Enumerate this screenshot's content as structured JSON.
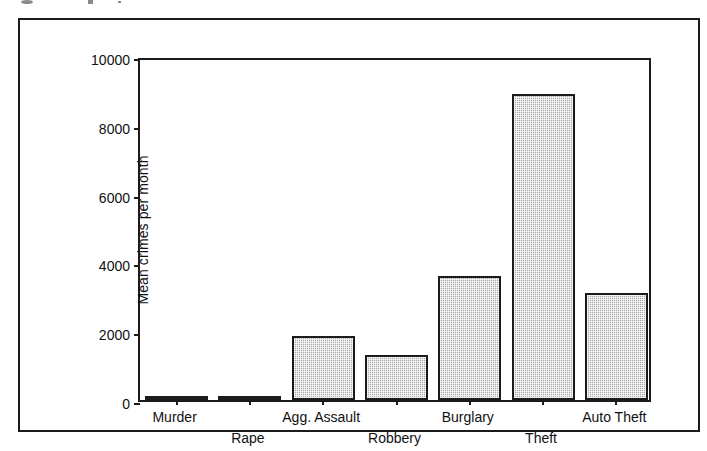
{
  "figure": {
    "background_color": "#ffffff",
    "frame_color": "#1b1b1b",
    "bar_fill_color": "#a8a8a8",
    "bar_edge_color": "#1b1b1b"
  },
  "chart_data": {
    "type": "bar",
    "title": "",
    "xlabel": "",
    "ylabel": "Mean crimes per month",
    "categories": [
      "Murder",
      "Rape",
      "Agg. Assault",
      "Robbery",
      "Burglary",
      "Theft",
      "Auto Theft"
    ],
    "values": [
      20,
      130,
      1860,
      1310,
      3610,
      8900,
      3110
    ],
    "ylim": [
      0,
      10000
    ],
    "yticks": [
      0,
      2000,
      4000,
      6000,
      8000,
      10000
    ],
    "ytick_labels": [
      "0",
      "2000",
      "4000",
      "6000",
      "8000",
      "10000"
    ],
    "grid": false,
    "legend": null,
    "label_rows": [
      0,
      1,
      0,
      1,
      0,
      1,
      0
    ]
  }
}
